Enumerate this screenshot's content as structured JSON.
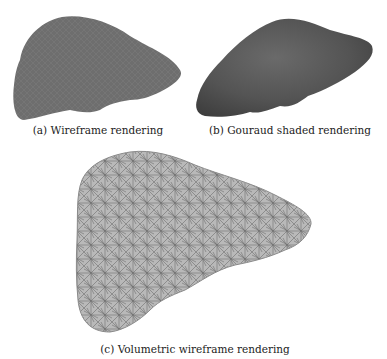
{
  "figure": {
    "subfigures": [
      {
        "label": "(a)",
        "caption": "(a) Wireframe rendering",
        "render_style": "wireframe",
        "color": "#6b6b6b"
      },
      {
        "label": "(b)",
        "caption": "(b) Gouraud shaded rendering",
        "render_style": "gouraud-shaded",
        "color": "#5c5c5c"
      },
      {
        "label": "(c)",
        "caption": "(c) Volumetric wireframe rendering",
        "render_style": "volumetric-wireframe",
        "color": "#8a8a8a"
      }
    ]
  }
}
